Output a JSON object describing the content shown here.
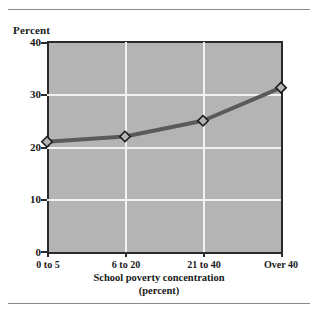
{
  "chart_data": {
    "type": "line",
    "title": "",
    "xlabel": "School poverty concentration",
    "xlabel_line2": "(percent)",
    "ylabel": "Percent",
    "categories": [
      "0 to 5",
      "6 to 20",
      "21 to 40",
      "Over 40"
    ],
    "values": [
      21.0,
      22.0,
      25.0,
      31.3
    ],
    "series": [
      {
        "name": "Percent",
        "values": [
          21.0,
          22.0,
          25.0,
          31.3
        ]
      }
    ],
    "ylim": [
      0,
      40
    ],
    "yticks": [
      0,
      10,
      20,
      30,
      40
    ],
    "ytick_labels": [
      "0",
      "10",
      "20",
      "30",
      "40"
    ],
    "grid": true,
    "grid_color": "#f2f2f2",
    "legend": false,
    "legend_position": "none",
    "marker": "diamond",
    "plot_background": "#b4b4b4",
    "line_color": "#5a5a5a",
    "marker_fill": "#b4b4b4",
    "marker_edge": "#1a1a1a",
    "axis_color": "#2b2b2b"
  },
  "ytick_labels": {
    "t0": "0",
    "t1": "10",
    "t2": "20",
    "t3": "30",
    "t4": "40"
  },
  "xtick_labels": {
    "t0": "0 to 5",
    "t1": "6 to 20",
    "t2": "21 to 40",
    "t3": "Over 40"
  },
  "axis_titles": {
    "y": "Percent",
    "x_line1": "School poverty concentration",
    "x_line2": "(percent)"
  }
}
